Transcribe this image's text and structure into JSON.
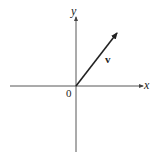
{
  "diagram": {
    "type": "vector-on-axes",
    "axes": {
      "x_label": "x",
      "y_label": "y",
      "origin_label": "0"
    },
    "vector": {
      "label": "v",
      "direction": "up-right",
      "from": "origin"
    },
    "colors": {
      "stroke": "#222222",
      "background": "#ffffff"
    }
  }
}
